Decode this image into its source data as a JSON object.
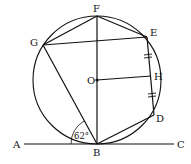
{
  "diagram": {
    "type": "circle-geometry",
    "labels": {
      "F": "F",
      "E": "E",
      "G": "G",
      "O": "O",
      "H": "H",
      "D": "D",
      "A": "A",
      "B": "B",
      "C": "C"
    },
    "angle_label": "62°",
    "points": {
      "O": [
        97,
        80
      ],
      "F": [
        97,
        16
      ],
      "B": [
        97,
        144
      ],
      "G": [
        43,
        45
      ],
      "E": [
        147,
        37
      ],
      "H": [
        151,
        76
      ],
      "D": [
        154,
        115
      ],
      "A": [
        24,
        144
      ],
      "C": [
        174,
        144
      ]
    },
    "circle": {
      "center": "O",
      "radius": 64
    },
    "segments": [
      [
        "F",
        "G"
      ],
      [
        "F",
        "E"
      ],
      [
        "G",
        "E"
      ],
      [
        "F",
        "B"
      ],
      [
        "G",
        "B"
      ],
      [
        "E",
        "D"
      ],
      [
        "O",
        "H"
      ],
      [
        "B",
        "D"
      ],
      [
        "A",
        "C"
      ]
    ],
    "tick_marks": [
      "E-H",
      "H-D"
    ],
    "angle_marked": {
      "vertex": "B",
      "between": [
        "A",
        "G"
      ],
      "value": "62°"
    },
    "colors": {
      "stroke": "#111111",
      "background": "#ffffff"
    }
  }
}
